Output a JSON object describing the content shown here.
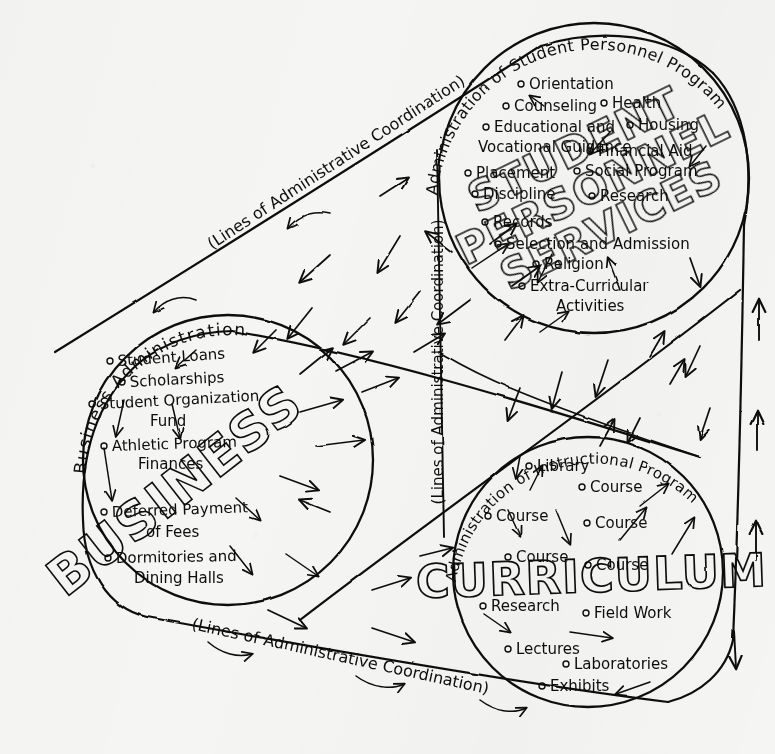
{
  "figure": {
    "kind": "hand-drawn administrative organization diagram",
    "background_color": "#f5f5f3",
    "ink_color": "#0d0d0d"
  },
  "band_labels": {
    "top_diagonal": "(Lines of Administrative Coordination)",
    "bottom_diagonal": "(Lines of Administrative Coordination)",
    "center_vertical": "(Lines of Administrative Coordination)"
  },
  "arc_labels": {
    "business": "Business  Administration",
    "personnel": "Administration of Student Personnel Program",
    "instructional": "Administration of Instructional Program"
  },
  "circles": [
    {
      "id": "business",
      "block_word": "BUSINESS",
      "arc_label": "Business  Administration",
      "center": [
        228,
        460
      ],
      "radius": 145,
      "items": [
        "Student Loans",
        "Scholarships",
        "Student Organization Fund",
        "Athletic Program Finances",
        "Deferred Payment of Fees",
        "Dormitories and Dining Halls"
      ]
    },
    {
      "id": "student-personnel",
      "block_word": "STUDENT PERSONNEL SERVICES",
      "block_lines": [
        "STUDENT",
        "PERSONNEL",
        "SERVICES"
      ],
      "arc_label": "Administration of Student Personnel Program",
      "center": [
        594,
        178
      ],
      "radius": 155,
      "items": [
        "Orientation",
        "Counseling",
        "Health",
        "Educational and Vocational Guidance",
        "Housing",
        "Financial Aid",
        "Placement",
        "Social Program",
        "Discipline",
        "Research",
        "Records",
        "Selection and Admission",
        "Religion",
        "Extra-Curricular Activities"
      ]
    },
    {
      "id": "curriculum",
      "block_word": "CURRICULUM",
      "arc_label": "Administration of Instructional Program",
      "center": [
        588,
        572
      ],
      "radius": 135,
      "items": [
        "Library",
        "Course",
        "Course",
        "Course",
        "Course",
        "Course",
        "Research",
        "Field Work",
        "Lectures",
        "Laboratories",
        "Exhibits"
      ]
    }
  ],
  "item_positions": {
    "business": [
      {
        "label": "Student Loans",
        "x": 116,
        "y": 365,
        "bullet": true
      },
      {
        "label": "Scholarships",
        "x": 128,
        "y": 386,
        "bullet": true
      },
      {
        "label": "Student Organization",
        "x": 98,
        "y": 407,
        "bullet": true
      },
      {
        "label": "Fund",
        "x": 152,
        "y": 424,
        "bullet": false
      },
      {
        "label": "Athletic Program",
        "x": 110,
        "y": 449,
        "bullet": true
      },
      {
        "label": "Finances",
        "x": 140,
        "y": 466,
        "bullet": false
      },
      {
        "label": "Deferred Payment",
        "x": 110,
        "y": 516,
        "bullet": true
      },
      {
        "label": "of Fees",
        "x": 148,
        "y": 534,
        "bullet": false
      },
      {
        "label": "Dormitories and",
        "x": 114,
        "y": 562,
        "bullet": true
      },
      {
        "label": "Dining Halls",
        "x": 136,
        "y": 580,
        "bullet": false
      }
    ],
    "student_personnel": [
      {
        "label": "Orientation",
        "x": 527,
        "y": 88,
        "bullet": true
      },
      {
        "label": "Counseling",
        "x": 512,
        "y": 110,
        "bullet": true
      },
      {
        "label": "Health",
        "x": 610,
        "y": 107,
        "bullet": true
      },
      {
        "label": "Educational and",
        "x": 492,
        "y": 131,
        "bullet": true
      },
      {
        "label": "Housing",
        "x": 636,
        "y": 129,
        "bullet": true
      },
      {
        "label": "Vocational Guidance",
        "x": 482,
        "y": 149,
        "bullet": false
      },
      {
        "label": "Financial Aid",
        "x": 596,
        "y": 155,
        "bullet": true
      },
      {
        "label": "Placement",
        "x": 474,
        "y": 177,
        "bullet": true
      },
      {
        "label": "Social Program",
        "x": 583,
        "y": 175,
        "bullet": true
      },
      {
        "label": "Discipline",
        "x": 481,
        "y": 198,
        "bullet": true
      },
      {
        "label": "Research",
        "x": 598,
        "y": 200,
        "bullet": true
      },
      {
        "label": "Records",
        "x": 491,
        "y": 226,
        "bullet": true
      },
      {
        "label": "Selection and Admission",
        "x": 504,
        "y": 248,
        "bullet": true
      },
      {
        "label": "Religion",
        "x": 542,
        "y": 268,
        "bullet": true
      },
      {
        "label": "Extra-Curricular",
        "x": 528,
        "y": 290,
        "bullet": true
      },
      {
        "label": "Activities",
        "x": 556,
        "y": 308,
        "bullet": false
      }
    ],
    "curriculum": [
      {
        "label": "Library",
        "x": 535,
        "y": 470,
        "bullet": true
      },
      {
        "label": "Course",
        "x": 588,
        "y": 491,
        "bullet": true
      },
      {
        "label": "Course",
        "x": 494,
        "y": 520,
        "bullet": true
      },
      {
        "label": "Course",
        "x": 593,
        "y": 527,
        "bullet": true
      },
      {
        "label": "Course",
        "x": 514,
        "y": 561,
        "bullet": true
      },
      {
        "label": "Course",
        "x": 594,
        "y": 569,
        "bullet": true
      },
      {
        "label": "Research",
        "x": 489,
        "y": 610,
        "bullet": true
      },
      {
        "label": "Field Work",
        "x": 592,
        "y": 617,
        "bullet": true
      },
      {
        "label": "Lectures",
        "x": 514,
        "y": 653,
        "bullet": true
      },
      {
        "label": "Laboratories",
        "x": 572,
        "y": 668,
        "bullet": true
      },
      {
        "label": "Exhibits",
        "x": 548,
        "y": 690,
        "bullet": true
      }
    ]
  }
}
